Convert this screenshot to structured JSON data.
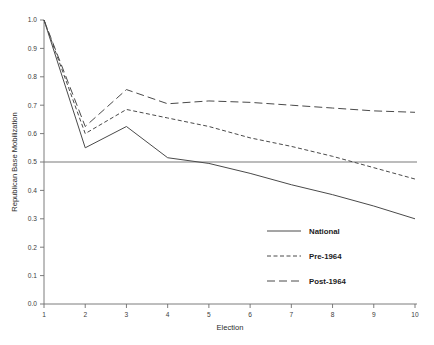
{
  "chart_data": {
    "type": "line",
    "title": "",
    "xlabel": "Election",
    "ylabel": "Republican Base Mobilization",
    "x": [
      1,
      2,
      3,
      4,
      5,
      6,
      7,
      8,
      9,
      10
    ],
    "xlim": [
      1,
      10
    ],
    "ylim": [
      0.0,
      1.0
    ],
    "grid": false,
    "legend_position": "bottom-right",
    "xticks": [
      "1",
      "2",
      "3",
      "4",
      "5",
      "6",
      "7",
      "8",
      "9",
      "10"
    ],
    "yticks": [
      "0.0",
      "0.1",
      "0.2",
      "0.3",
      "0.4",
      "0.5",
      "0.6",
      "0.7",
      "0.8",
      "0.9",
      "1.0"
    ],
    "ytick_values": [
      0.0,
      0.1,
      0.2,
      0.3,
      0.4,
      0.5,
      0.6,
      0.7,
      0.8,
      0.9,
      1.0
    ],
    "series": [
      {
        "name": "National",
        "style": "solid",
        "dash": "none",
        "color": "#4a4a4a",
        "values": [
          1.0,
          0.55,
          0.625,
          0.515,
          0.495,
          0.46,
          0.42,
          0.385,
          0.345,
          0.3
        ]
      },
      {
        "name": "Pre-1964",
        "style": "dashed",
        "dash": "4,2.5",
        "color": "#4a4a4a",
        "values": [
          1.0,
          0.6,
          0.685,
          0.655,
          0.625,
          0.585,
          0.555,
          0.52,
          0.48,
          0.44
        ]
      },
      {
        "name": "Post-1964",
        "style": "long-dashed",
        "dash": "8,4",
        "color": "#4a4a4a",
        "values": [
          1.0,
          0.625,
          0.755,
          0.705,
          0.715,
          0.71,
          0.7,
          0.69,
          0.68,
          0.675
        ]
      }
    ],
    "reference_lines": [
      {
        "name": "half-line",
        "orientation": "horizontal",
        "value": 0.5,
        "color": "#7a7a7a"
      }
    ],
    "annotations": []
  },
  "legend": {
    "entries": [
      {
        "label": "National"
      },
      {
        "label": "Pre-1964"
      },
      {
        "label": "Post-1964"
      }
    ]
  },
  "axes": {
    "x_title": "Election",
    "y_title": "Republican Base Mobilization"
  }
}
